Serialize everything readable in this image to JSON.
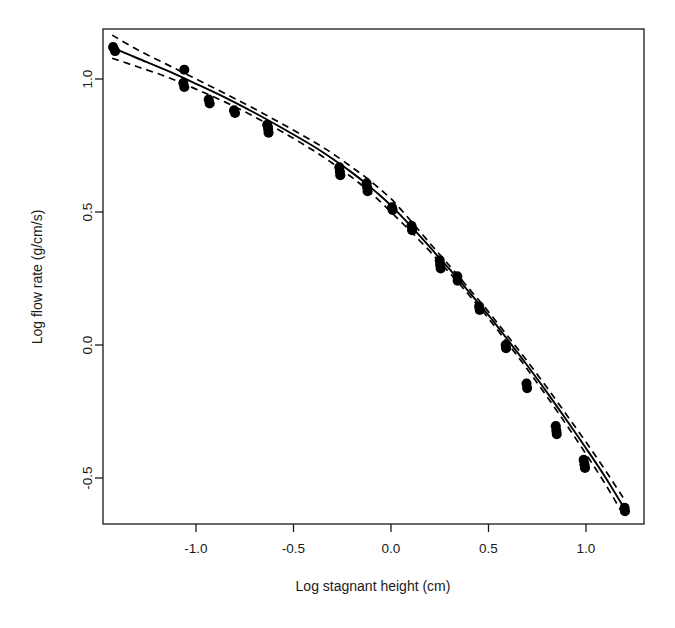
{
  "chart_data": {
    "type": "scatter",
    "title": "",
    "xlabel": "Log stagnant height (cm)",
    "ylabel": "Log flow rate (g/cm/s)",
    "xlim": [
      -1.43,
      1.3
    ],
    "ylim": [
      -0.68,
      1.21
    ],
    "grid": false,
    "legend": "none",
    "xticks": [
      -1.0,
      -0.5,
      0.0,
      0.5,
      1.0
    ],
    "xtick_labels": [
      "-1.0",
      "-0.5",
      "0.0",
      "0.5",
      "1.0"
    ],
    "yticks": [
      -0.5,
      0.0,
      0.5,
      1.0
    ],
    "ytick_labels": [
      "-0.5",
      "0.0",
      "0.5",
      "1.0"
    ],
    "series": [
      {
        "name": "Observed data",
        "type": "scatter",
        "marker": "filled-circle",
        "marker_size": 7.5,
        "color": "#000000",
        "points": [
          [
            -1.425,
            1.12
          ],
          [
            -1.415,
            1.105
          ],
          [
            -1.06,
            1.035
          ],
          [
            -1.065,
            0.985
          ],
          [
            -1.06,
            0.97
          ],
          [
            -0.935,
            0.923
          ],
          [
            -0.93,
            0.908
          ],
          [
            -0.805,
            0.882
          ],
          [
            -0.8,
            0.872
          ],
          [
            -0.635,
            0.828
          ],
          [
            -0.63,
            0.812
          ],
          [
            -0.628,
            0.798
          ],
          [
            -0.265,
            0.668
          ],
          [
            -0.262,
            0.651
          ],
          [
            -0.26,
            0.638
          ],
          [
            -0.125,
            0.608
          ],
          [
            -0.122,
            0.592
          ],
          [
            -0.12,
            0.578
          ],
          [
            0.005,
            0.518
          ],
          [
            0.008,
            0.508
          ],
          [
            0.105,
            0.448
          ],
          [
            0.108,
            0.432
          ],
          [
            0.25,
            0.318
          ],
          [
            0.252,
            0.302
          ],
          [
            0.255,
            0.288
          ],
          [
            0.34,
            0.258
          ],
          [
            0.342,
            0.242
          ],
          [
            0.452,
            0.145
          ],
          [
            0.455,
            0.132
          ],
          [
            0.588,
            0.0
          ],
          [
            0.59,
            -0.012
          ],
          [
            0.695,
            -0.145
          ],
          [
            0.698,
            -0.162
          ],
          [
            0.845,
            -0.305
          ],
          [
            0.848,
            -0.322
          ],
          [
            0.85,
            -0.335
          ],
          [
            0.988,
            -0.432
          ],
          [
            0.992,
            -0.448
          ],
          [
            0.995,
            -0.462
          ],
          [
            1.198,
            -0.612
          ],
          [
            1.2,
            -0.625
          ]
        ]
      },
      {
        "name": "Fitted curve",
        "type": "line",
        "style": "solid",
        "color": "#000000",
        "points": [
          [
            -1.43,
            1.118
          ],
          [
            -1.3,
            1.078
          ],
          [
            -1.15,
            1.032
          ],
          [
            -1.0,
            0.982
          ],
          [
            -0.85,
            0.93
          ],
          [
            -0.7,
            0.873
          ],
          [
            -0.55,
            0.812
          ],
          [
            -0.4,
            0.748
          ],
          [
            -0.3,
            0.7
          ],
          [
            -0.2,
            0.648
          ],
          [
            -0.12,
            0.602
          ],
          [
            -0.05,
            0.558
          ],
          [
            0.0,
            0.524
          ],
          [
            0.05,
            0.487
          ],
          [
            0.1,
            0.448
          ],
          [
            0.15,
            0.408
          ],
          [
            0.2,
            0.368
          ],
          [
            0.25,
            0.325
          ],
          [
            0.3,
            0.285
          ],
          [
            0.4,
            0.2
          ],
          [
            0.5,
            0.112
          ],
          [
            0.6,
            0.018
          ],
          [
            0.7,
            -0.078
          ],
          [
            0.8,
            -0.178
          ],
          [
            0.9,
            -0.282
          ],
          [
            1.0,
            -0.388
          ],
          [
            1.1,
            -0.498
          ],
          [
            1.2,
            -0.618
          ]
        ]
      },
      {
        "name": "Upper confidence band",
        "type": "line",
        "style": "dashed",
        "color": "#000000",
        "points": [
          [
            -1.43,
            1.165
          ],
          [
            -1.3,
            1.11
          ],
          [
            -1.15,
            1.055
          ],
          [
            -1.0,
            1.0
          ],
          [
            -0.85,
            0.945
          ],
          [
            -0.7,
            0.888
          ],
          [
            -0.55,
            0.828
          ],
          [
            -0.4,
            0.766
          ],
          [
            -0.3,
            0.72
          ],
          [
            -0.2,
            0.668
          ],
          [
            -0.12,
            0.625
          ],
          [
            -0.05,
            0.582
          ],
          [
            0.0,
            0.55
          ],
          [
            0.05,
            0.51
          ],
          [
            0.1,
            0.468
          ],
          [
            0.15,
            0.425
          ],
          [
            0.2,
            0.382
          ],
          [
            0.25,
            0.34
          ],
          [
            0.3,
            0.298
          ],
          [
            0.4,
            0.212
          ],
          [
            0.5,
            0.125
          ],
          [
            0.6,
            0.032
          ],
          [
            0.7,
            -0.062
          ],
          [
            0.8,
            -0.16
          ],
          [
            0.9,
            -0.262
          ],
          [
            1.0,
            -0.365
          ],
          [
            1.1,
            -0.472
          ],
          [
            1.2,
            -0.585
          ]
        ]
      },
      {
        "name": "Lower confidence band",
        "type": "line",
        "style": "dashed",
        "color": "#000000",
        "points": [
          [
            -1.43,
            1.078
          ],
          [
            -1.3,
            1.046
          ],
          [
            -1.15,
            1.008
          ],
          [
            -1.0,
            0.962
          ],
          [
            -0.85,
            0.913
          ],
          [
            -0.7,
            0.858
          ],
          [
            -0.55,
            0.798
          ],
          [
            -0.4,
            0.732
          ],
          [
            -0.3,
            0.683
          ],
          [
            -0.2,
            0.63
          ],
          [
            -0.12,
            0.582
          ],
          [
            -0.05,
            0.536
          ],
          [
            0.0,
            0.5
          ],
          [
            0.05,
            0.464
          ],
          [
            0.1,
            0.428
          ],
          [
            0.15,
            0.39
          ],
          [
            0.2,
            0.352
          ],
          [
            0.25,
            0.31
          ],
          [
            0.3,
            0.272
          ],
          [
            0.4,
            0.188
          ],
          [
            0.5,
            0.1
          ],
          [
            0.6,
            0.005
          ],
          [
            0.7,
            -0.092
          ],
          [
            0.8,
            -0.194
          ],
          [
            0.9,
            -0.3
          ],
          [
            1.0,
            -0.41
          ],
          [
            1.1,
            -0.524
          ],
          [
            1.2,
            -0.65
          ]
        ]
      }
    ]
  }
}
